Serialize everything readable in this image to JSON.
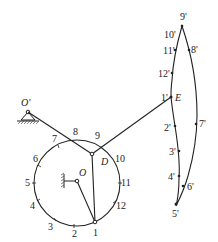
{
  "diagram": {
    "type": "four-bar linkage coupler curve construction",
    "colors": {
      "line": "#222222",
      "background": "#ffffff"
    },
    "fixed_pivots": [
      {
        "name": "O'",
        "label": "O'",
        "x": 28,
        "y": 112
      },
      {
        "name": "O",
        "label": "O",
        "x": 77,
        "y": 181
      }
    ],
    "crank_circle": {
      "cx": 77,
      "cy": 183,
      "r": 43
    },
    "joints": [
      {
        "name": "D",
        "label": "D",
        "x": 92,
        "y": 154
      },
      {
        "name": "E",
        "label": "E",
        "x": 171,
        "y": 97
      },
      {
        "name": "A1",
        "label": "1",
        "x": 95,
        "y": 222
      }
    ],
    "circle_labels": [
      {
        "label": "1",
        "x": 95,
        "y": 234
      },
      {
        "label": "2",
        "x": 74,
        "y": 234
      },
      {
        "label": "3",
        "x": 50,
        "y": 228
      },
      {
        "label": "4",
        "x": 32,
        "y": 208
      },
      {
        "label": "5",
        "x": 26,
        "y": 185
      },
      {
        "label": "6",
        "x": 35,
        "y": 160
      },
      {
        "label": "7",
        "x": 55,
        "y": 140
      },
      {
        "label": "8",
        "x": 75,
        "y": 133
      },
      {
        "label": "9",
        "x": 97,
        "y": 137
      },
      {
        "label": "10",
        "x": 115,
        "y": 160
      },
      {
        "label": "11",
        "x": 120,
        "y": 183
      },
      {
        "label": "12",
        "x": 115,
        "y": 206
      }
    ],
    "coupler_curve_points": [
      {
        "label": "1'",
        "x": 171,
        "y": 97
      },
      {
        "label": "2'",
        "x": 175,
        "y": 126
      },
      {
        "label": "3'",
        "x": 179,
        "y": 151
      },
      {
        "label": "4'",
        "x": 179,
        "y": 176
      },
      {
        "label": "5'",
        "x": 176,
        "y": 204
      },
      {
        "label": "6'",
        "x": 183,
        "y": 186
      },
      {
        "label": "7'",
        "x": 196,
        "y": 124
      },
      {
        "label": "8'",
        "x": 189,
        "y": 50
      },
      {
        "label": "9'",
        "x": 182,
        "y": 26
      },
      {
        "label": "10'",
        "x": 179,
        "y": 37
      },
      {
        "label": "11'",
        "x": 175,
        "y": 50
      },
      {
        "label": "12'",
        "x": 172,
        "y": 73
      }
    ]
  }
}
